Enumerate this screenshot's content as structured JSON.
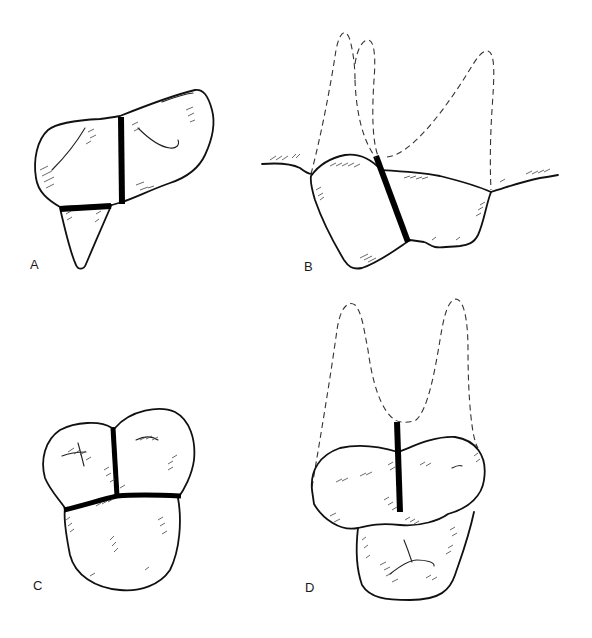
{
  "figure": {
    "panels": [
      {
        "id": "A",
        "label": "A",
        "view": "occlusal view of crown with single tapering root outline"
      },
      {
        "id": "B",
        "label": "B",
        "view": "side view of crown with dashed root outlines and gum line"
      },
      {
        "id": "C",
        "label": "C",
        "view": "occlusal view of three-lobed crown with T-shaped bar"
      },
      {
        "id": "D",
        "label": "D",
        "view": "front view of crown with two dashed roots and vertical bar"
      }
    ],
    "colors": {
      "background": "#ffffff",
      "line": "#111111",
      "bar": "#000000",
      "dashed": "#333333"
    }
  }
}
